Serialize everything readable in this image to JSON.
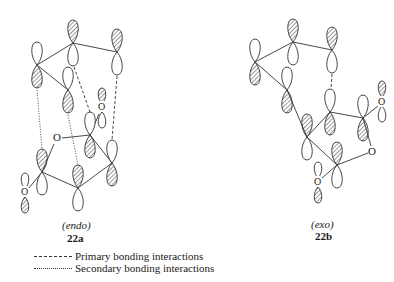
{
  "diagram": {
    "structures": [
      {
        "id": "22a",
        "caption": "(endo)",
        "label": "22a",
        "atom_labels": [
          "O",
          "O",
          "O"
        ]
      },
      {
        "id": "22b",
        "caption": "(exo)",
        "label": "22b",
        "atom_labels": [
          "O",
          "O",
          "O"
        ]
      }
    ],
    "legend": {
      "primary": "Primary bonding interactions",
      "secondary": "Secondary bonding interactions"
    },
    "colors": {
      "line": "#333333",
      "hatch": "#555555",
      "background": "#ffffff"
    }
  }
}
